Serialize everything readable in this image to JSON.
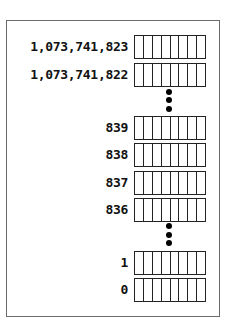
{
  "diagram": {
    "bits_per_cell": 8,
    "rows": [
      {
        "address": "1,073,741,823",
        "top": 35
      },
      {
        "address": "1,073,741,822",
        "top": 63
      },
      {
        "address": "839",
        "top": 116
      },
      {
        "address": "838",
        "top": 143
      },
      {
        "address": "837",
        "top": 171
      },
      {
        "address": "836",
        "top": 198
      },
      {
        "address": "1",
        "top": 251
      },
      {
        "address": "0",
        "top": 278
      }
    ],
    "ellipses": [
      {
        "after": "1,073,741,822",
        "dots_y": [
          92,
          100,
          109
        ]
      },
      {
        "after": "836",
        "dots_y": [
          226,
          235,
          243
        ]
      }
    ]
  }
}
